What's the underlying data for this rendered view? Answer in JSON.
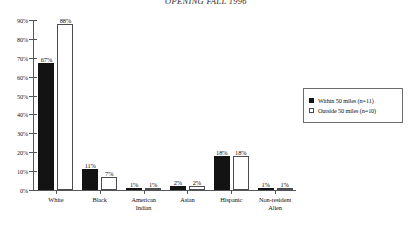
{
  "chart_data": {
    "type": "bar",
    "title": "OPENING FALL 1996",
    "xlabel": "",
    "ylabel": "",
    "ylim": [
      0,
      90
    ],
    "ytick_labels": [
      "0%",
      "10%",
      "20%",
      "30%",
      "40%",
      "50%",
      "60%",
      "70%",
      "80%",
      "90%"
    ],
    "ytick_values": [
      0,
      10,
      20,
      30,
      40,
      50,
      60,
      70,
      80,
      90
    ],
    "grid": false,
    "legend_position": "right",
    "categories": [
      "White",
      "Black",
      "American Indian",
      "Asian",
      "Hispanic",
      "Non-resident Alien"
    ],
    "category_lines": [
      [
        "White"
      ],
      [
        "Black"
      ],
      [
        "American",
        "Indian"
      ],
      [
        "Asian"
      ],
      [
        "Hispanic"
      ],
      [
        "Non-resident",
        "Alien"
      ]
    ],
    "series": [
      {
        "name": "Within 50 miles (n=11)",
        "color": "#131313",
        "values": [
          67,
          11,
          1,
          2,
          18,
          1
        ],
        "labels": [
          "67%",
          "11%",
          "1%",
          "2%",
          "18%",
          "1%"
        ]
      },
      {
        "name": "Outside 50 miles (n=10)",
        "color": "#ffffff",
        "values": [
          88,
          7,
          1,
          2,
          18,
          1
        ],
        "labels": [
          "88%",
          "7%",
          "1%",
          "2%",
          "18%",
          "1%"
        ]
      }
    ]
  },
  "legend": {
    "items": [
      {
        "label": "Within 50 miles (n=11)",
        "swatch": "filled-square-icon"
      },
      {
        "label": "Outside 50 miles (n=10)",
        "swatch": "hollow-square-icon"
      }
    ]
  }
}
